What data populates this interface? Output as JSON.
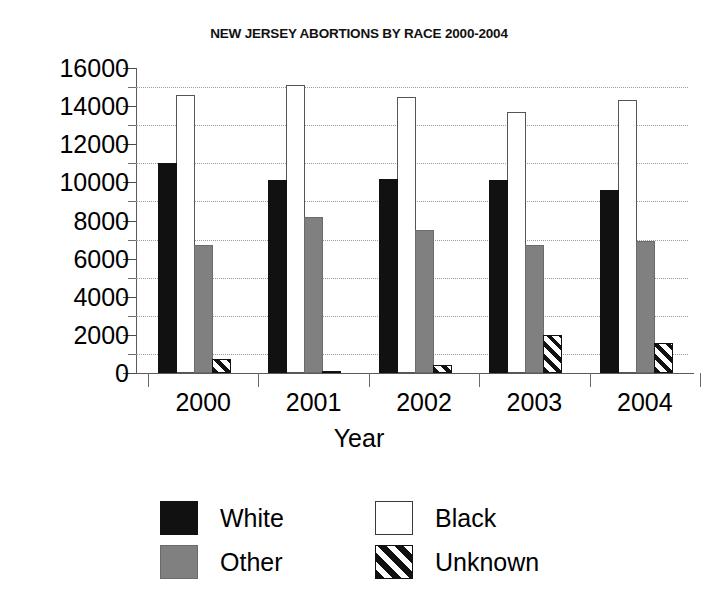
{
  "chart_data": {
    "type": "bar",
    "title": "NEW JERSEY ABORTIONS BY RACE 2000-2004",
    "xlabel": "Year",
    "ylabel": "",
    "categories": [
      "2000",
      "2001",
      "2002",
      "2003",
      "2004"
    ],
    "series": [
      {
        "name": "White",
        "values": [
          11000,
          10100,
          10200,
          10100,
          9600
        ]
      },
      {
        "name": "Black",
        "values": [
          14600,
          15100,
          14500,
          13700,
          14300
        ]
      },
      {
        "name": "Other",
        "values": [
          6700,
          8200,
          7500,
          6700,
          6900
        ]
      },
      {
        "name": "Unknown",
        "values": [
          750,
          100,
          430,
          2000,
          1600
        ]
      }
    ],
    "ylim": [
      0,
      16000
    ],
    "ytick_labels": [
      "0",
      "2000",
      "4000",
      "6000",
      "8000",
      "10000",
      "12000",
      "14000",
      "16000"
    ],
    "ytick_values": [
      0,
      2000,
      4000,
      6000,
      8000,
      10000,
      12000,
      14000,
      16000
    ],
    "yminor_values": [
      1000,
      3000,
      5000,
      7000,
      9000,
      11000,
      13000,
      15000
    ],
    "grid": "horizontal-dotted-minor",
    "legend_position": "bottom",
    "legend_entries": [
      {
        "label": "White",
        "swatch": "solid-black"
      },
      {
        "label": "Black",
        "swatch": "white-outline"
      },
      {
        "label": "Other",
        "swatch": "solid-gray"
      },
      {
        "label": "Unknown",
        "swatch": "diagonal-hatch"
      }
    ],
    "colors": {
      "White": "#111111",
      "Black": "#ffffff",
      "Other": "#808080",
      "Unknown": "#111111",
      "grid": "#9a9a9a",
      "axis": "#5a5a5a",
      "background": "#ffffff"
    }
  }
}
